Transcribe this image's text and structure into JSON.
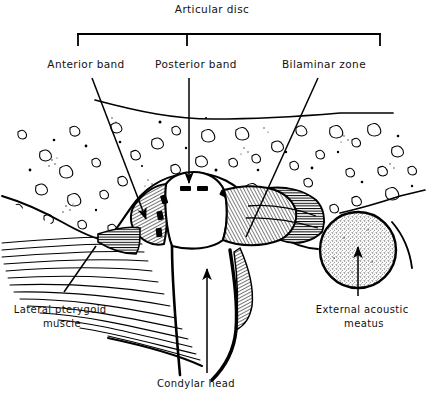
{
  "figure": {
    "title": "Articular disc",
    "background_color": "#ffffff",
    "ink_color": "#000000"
  },
  "bracket": {
    "name": "articular-disc-bracket",
    "left_x": 78,
    "right_x": 380,
    "center_x": 187,
    "top_y": 34,
    "leg_bottom_y": 45
  },
  "labels": [
    {
      "id": "articular-disc",
      "text": "Articular disc",
      "x": 212,
      "y": 13,
      "anchor": "middle",
      "lines": [
        "Articular disc"
      ]
    },
    {
      "id": "anterior-band",
      "text": "Anterior band",
      "x": 86,
      "y": 68,
      "anchor": "middle",
      "lines": [
        "Anterior band"
      ]
    },
    {
      "id": "posterior-band",
      "text": "Posterior band",
      "x": 196,
      "y": 68,
      "anchor": "middle",
      "lines": [
        "Posterior band"
      ]
    },
    {
      "id": "bilaminar-zone",
      "text": "Bilaminar zone",
      "x": 324,
      "y": 68,
      "anchor": "middle",
      "lines": [
        "Bilaminar zone"
      ]
    },
    {
      "id": "lateral-pterygoid-muscle",
      "text": "Lateral pterygoid muscle",
      "x": 62,
      "y": 313,
      "anchor": "middle",
      "lines": [
        "Lateral pterygoid",
        "muscle"
      ]
    },
    {
      "id": "condylar-head",
      "text": "Condylar head",
      "x": 196,
      "y": 387,
      "anchor": "middle",
      "lines": [
        "Condylar head"
      ]
    },
    {
      "id": "external-acoustic-meatus",
      "text": "External acoustic meatus",
      "x": 364,
      "y": 313,
      "anchor": "middle",
      "lines": [
        "External acoustic",
        "meatus"
      ]
    }
  ],
  "leaders": [
    {
      "id": "anterior-band-leader",
      "from": [
        92,
        78
      ],
      "to": [
        146,
        219
      ],
      "arrowhead": true,
      "style": "straight-line-with-arrow"
    },
    {
      "id": "posterior-band-leader",
      "from": [
        189,
        78
      ],
      "to": [
        189,
        183
      ],
      "arrowhead": true,
      "style": "vertical-line-with-arrow"
    },
    {
      "id": "bilaminar-zone-leader",
      "from": [
        318,
        78
      ],
      "to": [
        246,
        237
      ],
      "arrowhead": false,
      "style": "straight-line"
    },
    {
      "id": "lateral-pterygoid-leader",
      "from": [
        64,
        292
      ],
      "to": [
        96,
        246
      ],
      "arrowhead": false,
      "style": "straight-line"
    },
    {
      "id": "condylar-head-leader",
      "from": [
        207,
        373
      ],
      "to": [
        207,
        269
      ],
      "arrowhead": true,
      "style": "vertical-line-with-arrow"
    },
    {
      "id": "external-acoustic-meatus-leader",
      "from": [
        358,
        296
      ],
      "to": [
        358,
        247
      ],
      "arrowhead": true,
      "style": "vertical-line-with-arrow"
    }
  ],
  "anatomy": {
    "temporal_bone": {
      "name": "temporal-bone-cancellous",
      "fill": "#ffffff",
      "texture": "trabecular-blobs-and-stipple"
    },
    "glenoid_fossa": {
      "name": "glenoid-fossa-outline"
    },
    "articular_disc": {
      "name": "articular-disc-body",
      "texture": "fine-hatching",
      "marker": "thick-black-dashes"
    },
    "condyle": {
      "name": "mandibular-condyle-head",
      "fill": "#ffffff"
    },
    "lateral_pterygoid": {
      "name": "lateral-pterygoid-fibers",
      "texture": "fanned-fiber-lines"
    },
    "external_acoustic_meatus": {
      "name": "external-acoustic-meatus-circle",
      "center": [
        358,
        250
      ],
      "radius": 39,
      "fill": "stipple-gray"
    }
  }
}
